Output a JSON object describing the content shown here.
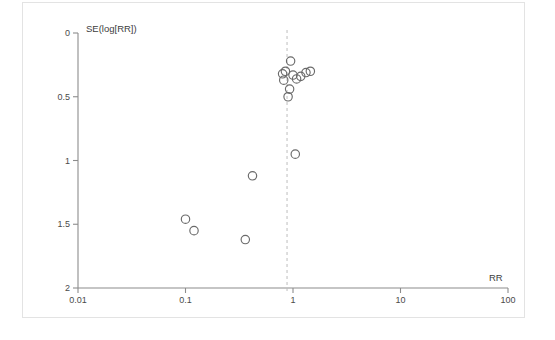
{
  "figure": {
    "background_color": "#ffffff",
    "frame_color": "#e3e3e3",
    "axis_color": "#8c8c8c",
    "point_color": "#6a6a6a",
    "reference_line_color": "#bdbdbd"
  },
  "chart_data": {
    "type": "scatter",
    "title": "",
    "subtitle": "",
    "xlabel": "RR",
    "ylabel": "SE(log[RR])",
    "x_scale": "log",
    "xlim": [
      0.01,
      100
    ],
    "ylim": [
      0,
      2
    ],
    "y_inverted": true,
    "grid": false,
    "legend": null,
    "xticks": [
      0.01,
      0.1,
      1,
      10,
      100
    ],
    "xtick_labels": [
      "0.01",
      "0.1",
      "1",
      "10",
      "100"
    ],
    "yticks": [
      0,
      0.5,
      1,
      1.5,
      2
    ],
    "ytick_labels": [
      "0",
      "0.5",
      "1",
      "1.5",
      "2"
    ],
    "annotations": [
      {
        "name": "pooled-effect-reference-line",
        "type": "vline",
        "x": 0.88,
        "style": "dashed"
      }
    ],
    "marker": {
      "shape": "circle",
      "filled": false,
      "radius_px": 4.2
    },
    "series": [
      {
        "name": "studies",
        "x": [
          0.8,
          0.82,
          0.95,
          0.85,
          1.0,
          1.08,
          1.18,
          1.32,
          1.45,
          0.93,
          0.9,
          1.05,
          0.42,
          0.36,
          0.1,
          0.12
        ],
        "y": [
          0.32,
          0.37,
          0.22,
          0.3,
          0.33,
          0.36,
          0.34,
          0.31,
          0.3,
          0.44,
          0.5,
          0.95,
          1.12,
          1.62,
          1.46,
          1.55
        ]
      }
    ],
    "points": [
      {
        "x": 0.8,
        "y": 0.32
      },
      {
        "x": 0.82,
        "y": 0.37
      },
      {
        "x": 0.95,
        "y": 0.22
      },
      {
        "x": 0.85,
        "y": 0.3
      },
      {
        "x": 1.0,
        "y": 0.33
      },
      {
        "x": 1.08,
        "y": 0.36
      },
      {
        "x": 1.18,
        "y": 0.34
      },
      {
        "x": 1.32,
        "y": 0.31
      },
      {
        "x": 1.45,
        "y": 0.3
      },
      {
        "x": 0.93,
        "y": 0.44
      },
      {
        "x": 0.9,
        "y": 0.5
      },
      {
        "x": 1.05,
        "y": 0.95
      },
      {
        "x": 0.42,
        "y": 1.12
      },
      {
        "x": 0.36,
        "y": 1.62
      },
      {
        "x": 0.1,
        "y": 1.46
      },
      {
        "x": 0.12,
        "y": 1.55
      }
    ]
  }
}
